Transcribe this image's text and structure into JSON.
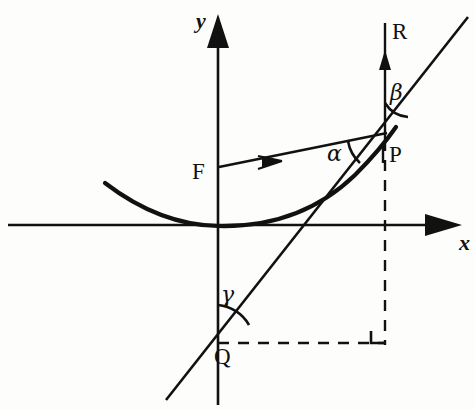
{
  "figure": {
    "background_color": "#fdfdfc",
    "ink_color": "#111111"
  },
  "axes": {
    "x_label": "x",
    "y_label": "y",
    "origin": {
      "x": 218,
      "y": 225
    },
    "x_axis": {
      "start_x": 8,
      "end_x": 462,
      "y": 225,
      "arrow": "right"
    },
    "y_axis": {
      "x": 218,
      "start_y": 405,
      "end_y": 22,
      "arrow": "up"
    }
  },
  "points": {
    "focus": {
      "label": "F",
      "x": 218,
      "y": 168
    },
    "tangency": {
      "label": "P",
      "x": 385,
      "y": 133
    },
    "tangent_y_intercept": {
      "label": "Q",
      "x": 218,
      "y": 345
    },
    "reflected_ray": {
      "label": "R",
      "x": 385,
      "y": 30
    }
  },
  "angles": {
    "alpha": {
      "label": "α",
      "at": "P",
      "between": "incident-ray and tangent"
    },
    "beta": {
      "label": "β",
      "at": "P",
      "between": "vertical reflected ray R and tangent"
    },
    "gamma": {
      "label": "γ",
      "at": "Q",
      "between": "y-axis and tangent"
    },
    "right_angle": {
      "label": "right-angle-marker",
      "x": 385,
      "y": 343
    }
  },
  "curves": {
    "parabola": {
      "vertex_x": 218,
      "vertex_y": 225,
      "opens": "up"
    },
    "tangent_line": {
      "through": [
        "Q",
        "P"
      ]
    },
    "incident_ray": {
      "from": "F",
      "to": "P",
      "arrow": "toward P"
    },
    "reflected_ray_line": {
      "from": "P",
      "direction": "vertical up",
      "arrow": "up"
    },
    "dashed_vertical": {
      "x": 385,
      "from_y": 133,
      "to_y": 345
    },
    "dashed_horizontal": {
      "y": 343,
      "from_x": 218,
      "to_x": 385
    }
  }
}
